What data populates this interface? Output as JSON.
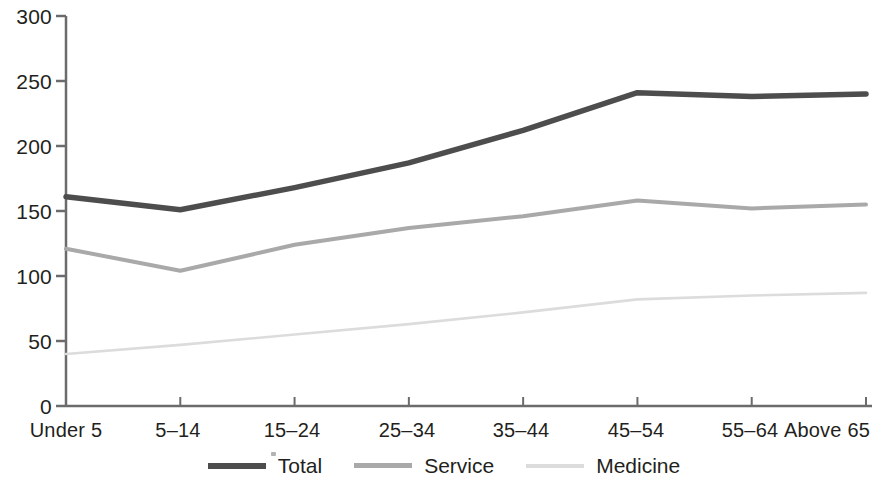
{
  "chart_data": {
    "type": "line",
    "title": "",
    "subtitle": "",
    "xlabel": "",
    "ylabel": "",
    "categories": [
      "Under 5",
      "5–14",
      "15–24",
      "25–34",
      "35–44",
      "45–54",
      "55–64",
      "Above 65"
    ],
    "series": [
      {
        "name": "Total",
        "color": "#4d4d4d",
        "values": [
          161,
          151,
          168,
          187,
          212,
          241,
          238,
          240
        ]
      },
      {
        "name": "Service",
        "color": "#a9a9a9",
        "values": [
          121,
          104,
          124,
          137,
          146,
          158,
          152,
          155
        ]
      },
      {
        "name": "Medicine",
        "color": "#dcdcdc",
        "values": [
          40,
          47,
          55,
          63,
          72,
          82,
          85,
          87
        ]
      }
    ],
    "ylim": [
      0,
      300
    ],
    "yticks": [
      0,
      50,
      100,
      150,
      200,
      250,
      300
    ],
    "ytick_labels": [
      "0",
      "50",
      "100",
      "150",
      "200",
      "250",
      "300"
    ],
    "grid": false,
    "legend_position": "bottom"
  },
  "axes": {
    "y_labels": [
      "300",
      "250",
      "200",
      "150",
      "100",
      "50",
      "0"
    ],
    "x_labels": [
      "Under 5",
      "5–14",
      "15–24",
      "25–34",
      "35–44",
      "45–54",
      "55–64",
      "Above 65"
    ]
  },
  "legend": {
    "items": [
      {
        "label": "Total",
        "color": "#4d4d4d"
      },
      {
        "label": "Service",
        "color": "#a9a9a9"
      },
      {
        "label": "Medicine",
        "color": "#dcdcdc"
      }
    ]
  }
}
